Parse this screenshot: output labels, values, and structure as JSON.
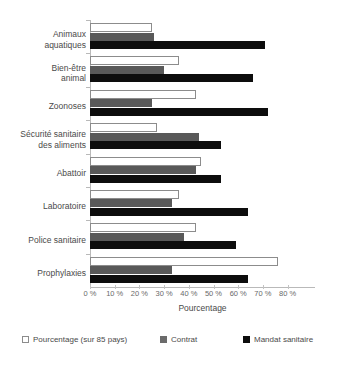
{
  "chart_data": {
    "type": "bar",
    "orientation": "horizontal",
    "title": "",
    "xlabel": "Pourcentage",
    "ylabel": "",
    "xlim": [
      0,
      80
    ],
    "xticks": [
      "0 %",
      "10 %",
      "20 %",
      "30 %",
      "40 %",
      "50 %",
      "60 %",
      "70 %",
      "80 %"
    ],
    "xtick_values": [
      0,
      10,
      20,
      30,
      40,
      50,
      60,
      70,
      80
    ],
    "grid": false,
    "legend_position": "bottom",
    "categories": [
      "Animaux aquatiques",
      "Bien-être animal",
      "Zoonoses",
      "Sécurité sanitaire des aliments",
      "Abattoir",
      "Laboratoire",
      "Police sanitaire",
      "Prophylaxies"
    ],
    "series": [
      {
        "name": "Pourcentage (sur 85 pays)",
        "color": "#ffffff",
        "edge_color": "#8c8c8c",
        "values": [
          25,
          36,
          43,
          27,
          45,
          36,
          43,
          76
        ]
      },
      {
        "name": "Contrat",
        "color": "#595959",
        "values": [
          26,
          30,
          25,
          44,
          43,
          33,
          38,
          33
        ]
      },
      {
        "name": "Mandat sanitaire",
        "color": "#0d0d0d",
        "values": [
          71,
          66,
          72,
          53,
          53,
          64,
          59,
          64
        ]
      }
    ]
  },
  "category_lines": [
    [
      "Animaux",
      "aquatiques"
    ],
    [
      "Bien-être",
      "animal"
    ],
    [
      "Zoonoses"
    ],
    [
      "Sécurité sanitaire",
      "des aliments"
    ],
    [
      "Abattoir"
    ],
    [
      "Laboratoire"
    ],
    [
      "Police sanitaire"
    ],
    [
      "Prophylaxies"
    ]
  ]
}
